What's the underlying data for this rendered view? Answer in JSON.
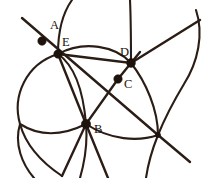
{
  "figure": {
    "canvas": {
      "width": 212,
      "height": 178,
      "background": "#ffffff"
    },
    "stroke_color": "#2b1d16",
    "dot_color": "#1d120c",
    "labels": [
      {
        "id": "A",
        "text": "A",
        "x": 50,
        "y": 29
      },
      {
        "id": "E",
        "text": "E",
        "x": 62,
        "y": 46
      },
      {
        "id": "D",
        "text": "D",
        "x": 120,
        "y": 56
      },
      {
        "id": "C",
        "text": "C",
        "x": 124,
        "y": 88
      },
      {
        "id": "B",
        "text": "B",
        "x": 94,
        "y": 133
      }
    ],
    "points": [
      {
        "id": "A",
        "x": 42,
        "y": 41,
        "r": 4.2,
        "kind": "marked-point"
      },
      {
        "id": "E",
        "x": 58,
        "y": 54,
        "r": 4.2,
        "kind": "intersection"
      },
      {
        "id": "D",
        "x": 131,
        "y": 63,
        "r": 4.4,
        "kind": "intersection"
      },
      {
        "id": "C",
        "x": 118,
        "y": 79,
        "r": 4.2,
        "kind": "marked-point"
      },
      {
        "id": "B",
        "x": 86,
        "y": 124,
        "r": 4.6,
        "kind": "intersection"
      },
      {
        "id": "F",
        "x": 158,
        "y": 135,
        "r": 2.6,
        "kind": "intersection"
      }
    ],
    "curves": [
      {
        "id": "circle-left-large",
        "d": "M 58 54 C 26 64 12 96 20 124 C 26 146 44 164 62 176"
      },
      {
        "id": "circle-left-lower",
        "d": "M 20 124 C 34 133 56 139 86 124"
      },
      {
        "id": "circle-mid-main",
        "d": "M 58 54 C 78 68 84 100 86 124 C 88 146 84 164 80 178"
      },
      {
        "id": "arc-top-through-E",
        "d": "M 72 0 C 62 14 58 34 58 54"
      },
      {
        "id": "arc-E-to-D-top",
        "d": "M 58 54 C 84 40 116 46 131 63"
      },
      {
        "id": "arc-D-down-right",
        "d": "M 131 63 C 146 82 158 110 158 135"
      },
      {
        "id": "arc-B-to-F-bottom",
        "d": "M 86 124 C 110 140 138 142 158 135"
      },
      {
        "id": "arc-top-right-down",
        "d": "M 130 0 C 131 22 131 44 131 63"
      },
      {
        "id": "arc-far-right",
        "d": "M 196 10 C 204 34 198 62 184 84 C 172 104 164 120 158 135"
      },
      {
        "id": "arc-right-lower",
        "d": "M 158 135 C 152 150 148 164 146 178"
      },
      {
        "id": "arc-left-bottom",
        "d": "M 20 124 C 14 144 22 164 34 178"
      }
    ],
    "rays": [
      {
        "id": "ray-A-E-B-F",
        "d": "M 22 18 L 158 135 L 190 162"
      },
      {
        "id": "ray-E-D-up",
        "d": "M 58 54 L 131 63 L 200 20"
      },
      {
        "id": "ray-E-B-down",
        "d": "M 58 54 L 86 124 L 108 178"
      },
      {
        "id": "ray-D-C-B",
        "d": "M 140 52 L 131 63 L 118 79 L 86 124 L 62 176"
      }
    ]
  }
}
